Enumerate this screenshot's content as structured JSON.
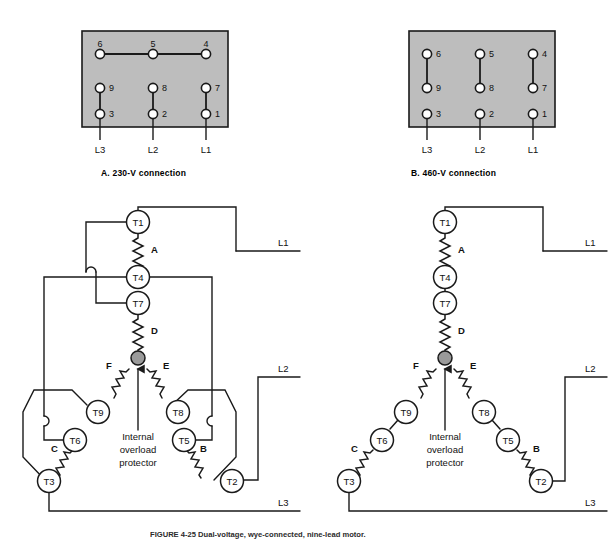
{
  "figure": {
    "caption": "FIGURE 4-25   Dual-voltage, wye-connected, nine-lead motor."
  },
  "panels": [
    {
      "id": "A",
      "title": "A. 230-V connection",
      "terminal_box": {
        "rows": [
          {
            "labels": [
              "6",
              "5",
              "4"
            ],
            "label_position": "above"
          },
          {
            "labels": [
              "9",
              "8",
              "7"
            ],
            "label_position": "right"
          },
          {
            "labels": [
              "3",
              "2",
              "1"
            ],
            "label_position": "right"
          }
        ],
        "jumpers": [
          "6-5",
          "5-4",
          "9-3",
          "8-2",
          "7-1"
        ],
        "line_labels": [
          "L3",
          "L2",
          "L1"
        ]
      },
      "wiring": {
        "terminals": [
          "T1",
          "T4",
          "T7",
          "T9",
          "T6",
          "T3",
          "T8",
          "T5",
          "T2"
        ],
        "coils": [
          "A",
          "D",
          "F",
          "E",
          "C",
          "B"
        ],
        "hub_label": "Internal\noverload\nprotector",
        "hub_text_lines": [
          "Internal",
          "overload",
          "protector"
        ],
        "supply_lines": [
          "L1",
          "L2",
          "L3"
        ]
      }
    },
    {
      "id": "B",
      "title": "B. 460-V connection",
      "terminal_box": {
        "rows": [
          {
            "labels": [
              "6",
              "5",
              "4"
            ],
            "label_position": "right"
          },
          {
            "labels": [
              "9",
              "8",
              "7"
            ],
            "label_position": "right"
          },
          {
            "labels": [
              "3",
              "2",
              "1"
            ],
            "label_position": "right"
          }
        ],
        "jumpers": [
          "6-9",
          "5-8",
          "4-7"
        ],
        "line_labels": [
          "L3",
          "L2",
          "L1"
        ]
      },
      "wiring": {
        "terminals": [
          "T1",
          "T4",
          "T7",
          "T9",
          "T6",
          "T3",
          "T8",
          "T5",
          "T2"
        ],
        "coils": [
          "A",
          "D",
          "F",
          "E",
          "C",
          "B"
        ],
        "hub_text_lines": [
          "Internal",
          "overload",
          "protector"
        ],
        "supply_lines": [
          "L1",
          "L2",
          "L3"
        ]
      }
    }
  ],
  "colors": {
    "box_fill": "#bdbdbd",
    "box_stroke": "#1a1a1a",
    "wire": "#1a1a1a",
    "hub_fill": "#9a9a9a",
    "node_fill": "#ffffff",
    "text": "#111111"
  }
}
